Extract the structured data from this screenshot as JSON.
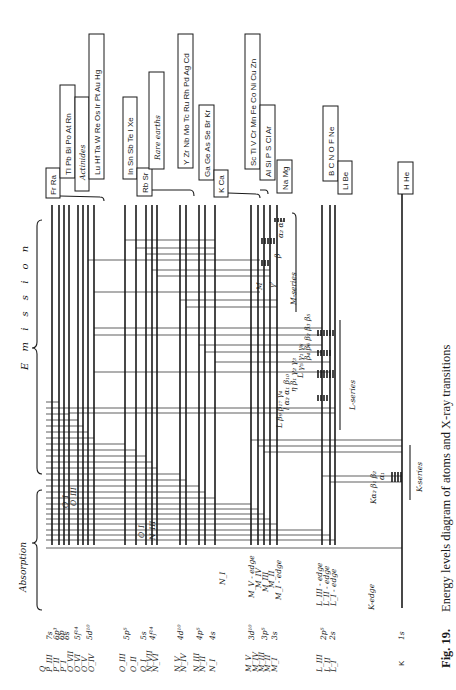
{
  "figure": {
    "number": "Fig. 19.",
    "caption": "Energy levels diagram of atoms and X-ray transitions"
  },
  "sections": {
    "emission": "E m i s s i o n",
    "absorption": "Absorption"
  },
  "element_groups": [
    {
      "id": "frra",
      "label": "Fr Ra"
    },
    {
      "id": "tl-rn",
      "label": "Tl Pb Bi Po At Rn"
    },
    {
      "id": "actinides",
      "label": "Actinides"
    },
    {
      "id": "lu-hg",
      "label": "Lu Hf Ta W Re Os Ir Pt Au Hg"
    },
    {
      "id": "in-xe",
      "label": "In Sn Sb Te I Xe"
    },
    {
      "id": "rbsr",
      "label": "Rb Sr"
    },
    {
      "id": "rare-earths",
      "label": "Rare earths"
    },
    {
      "id": "y-cd",
      "label": "Y Zr Nb Mo Tc Ru Rh Pd Ag Cd"
    },
    {
      "id": "ga-kr",
      "label": "Ga Ge As Se Br Kr"
    },
    {
      "id": "kca",
      "label": "K Ca"
    },
    {
      "id": "sc-zn",
      "label": "Sc Ti V Cr Mn Fe Co Ni Cu Zn"
    },
    {
      "id": "al-ar",
      "label": "Al Si P S Cl Ar"
    },
    {
      "id": "namg",
      "label": "Na Mg"
    },
    {
      "id": "b-ne",
      "label": "B C N O F Ne"
    },
    {
      "id": "libe",
      "label": "Li Be"
    },
    {
      "id": "hhe",
      "label": "H He"
    }
  ],
  "shell_labels": {
    "q_group": [
      "Q",
      "P_III",
      "P_II",
      "P_I",
      "O_VII",
      "O_VI",
      "O_V",
      "O_IV"
    ],
    "o_group": [
      "O_III",
      "O_II",
      "O_I",
      "N_VII",
      "N_VI"
    ],
    "n_group": [
      "N_V",
      "N_IV",
      "N_III",
      "N_II",
      "N_I"
    ],
    "m_group": [
      "M_V",
      "M_IV",
      "M_III",
      "M_II",
      "M_I"
    ],
    "l_group": [
      "L_III",
      "L_II",
      "L_I"
    ],
    "k_group": [
      "K"
    ]
  },
  "orbital_labels": {
    "q_group": [
      "7s",
      "6p³",
      "6p",
      "6s",
      "5f¹⁴",
      "5d¹⁰"
    ],
    "o_group": [
      "5p⁵",
      "5s",
      "4f¹⁴"
    ],
    "n_group": [
      "4d¹⁰",
      "4p⁵",
      "4s"
    ],
    "m_group": [
      "3d¹⁰",
      "3p⁵",
      "3s"
    ],
    "l_group": [
      "2p⁵",
      "2s"
    ],
    "k_group": [
      "1s"
    ]
  },
  "edge_labels": {
    "o": [
      "O_I",
      "O_III"
    ],
    "n": [
      "O_I",
      "N_III"
    ],
    "n1": "N_I",
    "m": [
      "M_V - edge",
      "M_IV",
      "M_III",
      "M_II",
      "M_I - edge"
    ],
    "l": [
      "L_III - edge",
      "L_II - edge",
      "L_I - edge"
    ],
    "k": "K-edge"
  },
  "series": {
    "m": {
      "label": "M-series",
      "lines": [
        "α₂ α₁",
        "β",
        "γ'",
        "M"
      ]
    },
    "l": {
      "label": "L-series",
      "lines": [
        "β₄ β₆ β₂ β₃ β₅",
        "L γ₅ γ₁ γ₆",
        "η β₁ γ₂ γ₃",
        "l α₂ α₁ β₁₀",
        "L β₉ β₁₇ γ₄"
      ]
    },
    "k": {
      "label": "K-series",
      "lines": [
        "Kα₂ β₁ β₂",
        "α₁"
      ]
    }
  }
}
